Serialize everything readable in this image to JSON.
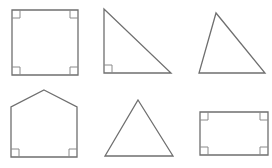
{
  "canvas": {
    "width": 272,
    "height": 168,
    "background": "#ffffff"
  },
  "colors": {
    "stroke": "#6f6f6f",
    "mark": "#8a8a8a"
  },
  "shapes": [
    {
      "name": "square",
      "points": [
        [
          12,
          10
        ],
        [
          78,
          10
        ],
        [
          78,
          75
        ],
        [
          12,
          75
        ]
      ],
      "right_angles": [
        {
          "corner": [
            12,
            10
          ],
          "dx": 1,
          "dy": 1
        },
        {
          "corner": [
            78,
            10
          ],
          "dx": -1,
          "dy": 1
        },
        {
          "corner": [
            12,
            75
          ],
          "dx": 1,
          "dy": -1
        },
        {
          "corner": [
            78,
            75
          ],
          "dx": -1,
          "dy": -1
        }
      ]
    },
    {
      "name": "right-triangle",
      "points": [
        [
          104,
          9
        ],
        [
          104,
          73
        ],
        [
          171,
          73
        ]
      ],
      "right_angles": [
        {
          "corner": [
            104,
            73
          ],
          "dx": 1,
          "dy": -1
        }
      ]
    },
    {
      "name": "acute-triangle",
      "points": [
        [
          216,
          13
        ],
        [
          199,
          73
        ],
        [
          265,
          73
        ]
      ],
      "right_angles": []
    },
    {
      "name": "pentagon",
      "points": [
        [
          44,
          90
        ],
        [
          77,
          107
        ],
        [
          77,
          157
        ],
        [
          11,
          157
        ],
        [
          11,
          107
        ]
      ],
      "right_angles": [
        {
          "corner": [
            11,
            157
          ],
          "dx": 1,
          "dy": -1
        },
        {
          "corner": [
            77,
            157
          ],
          "dx": -1,
          "dy": -1
        }
      ]
    },
    {
      "name": "isosceles-triangle",
      "points": [
        [
          138,
          100
        ],
        [
          173,
          156
        ],
        [
          105,
          156
        ]
      ],
      "right_angles": []
    },
    {
      "name": "rectangle",
      "points": [
        [
          200,
          112
        ],
        [
          268,
          112
        ],
        [
          268,
          155
        ],
        [
          200,
          155
        ]
      ],
      "right_angles": [
        {
          "corner": [
            200,
            112
          ],
          "dx": 1,
          "dy": 1
        },
        {
          "corner": [
            268,
            112
          ],
          "dx": -1,
          "dy": 1
        },
        {
          "corner": [
            200,
            155
          ],
          "dx": 1,
          "dy": -1
        },
        {
          "corner": [
            268,
            155
          ],
          "dx": -1,
          "dy": -1
        }
      ]
    }
  ],
  "mark_size": 8
}
